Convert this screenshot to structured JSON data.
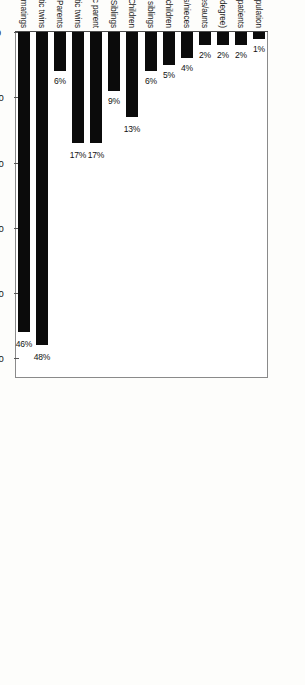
{
  "chart_data": {
    "type": "bar",
    "orientation": "rotated-90",
    "title": "",
    "xlabel": "Lifetime risk of developing schizophrenia (per cent)",
    "ylabel": "",
    "xlim": [
      0,
      53
    ],
    "ticks": [
      0,
      10,
      20,
      30,
      40,
      50
    ],
    "grid": false,
    "legend": "none",
    "categories": [
      "General population",
      "Spouses of patients",
      "First cousins (third-degree)",
      "Uncles/aunts",
      "Nephews/nieces",
      "Grandchildren",
      "Half siblings",
      "Children",
      "Siblings",
      "Siblings with one schizophrenic parent",
      "Dizygotic twins",
      "Parents",
      "Monozygotic twins",
      "Offspring of dual matings"
    ],
    "values": [
      1,
      2,
      2,
      2,
      4,
      5,
      6,
      13,
      9,
      17,
      17,
      6,
      48,
      46
    ],
    "value_labels": [
      "1%",
      "2%",
      "2%",
      "2%",
      "4%",
      "5%",
      "6%",
      "13%",
      "9%",
      "17%",
      "17%",
      "6%",
      "48%",
      "46%"
    ],
    "groups": [
      {
        "label": "Second-degree\nrelatives",
        "from": 2,
        "to": 6
      },
      {
        "label": "First-degree\nrelatives",
        "from": 7,
        "to": 13
      }
    ],
    "bar_color": "#0b0b0b",
    "frame_color": "#8a8a8a",
    "background": "#ffffff"
  }
}
